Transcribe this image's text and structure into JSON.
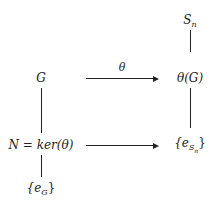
{
  "diagram": {
    "nodes": {
      "sn": {
        "base": "S",
        "sub": "n"
      },
      "g": {
        "text": "G"
      },
      "theta_g": {
        "text": "θ(G)"
      },
      "kernel": {
        "text": "N = ker(θ)"
      },
      "e_sn": {
        "prefix": "{e",
        "sub": "S",
        "subsub": "n",
        "suffix": "}"
      },
      "e_g": {
        "prefix": "{e",
        "sub": "G",
        "suffix": "}"
      }
    },
    "edges": [
      {
        "from": "g",
        "to": "theta_g",
        "type": "arrow",
        "label": "θ"
      },
      {
        "from": "kernel",
        "to": "e_sn",
        "type": "arrow",
        "label": ""
      },
      {
        "from": "sn",
        "to": "theta_g",
        "type": "line"
      },
      {
        "from": "g",
        "to": "kernel",
        "type": "line"
      },
      {
        "from": "theta_g",
        "to": "e_sn",
        "type": "line"
      },
      {
        "from": "kernel",
        "to": "e_g",
        "type": "line"
      }
    ],
    "arrow_label": "θ"
  }
}
